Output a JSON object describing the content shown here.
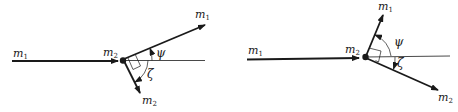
{
  "diagrams": [
    {
      "id": "left",
      "incoming_label": {
        "base": "m",
        "sub": "1"
      },
      "target_label": {
        "base": "m",
        "sub": "2"
      },
      "outgoing_1_label": {
        "base": "m",
        "sub": "1"
      },
      "outgoing_2_label": {
        "base": "m",
        "sub": "2"
      },
      "angle_1": "ψ",
      "angle_2": "ζ"
    },
    {
      "id": "right",
      "incoming_label": {
        "base": "m",
        "sub": "1"
      },
      "target_label": {
        "base": "m",
        "sub": "2"
      },
      "outgoing_1_label": {
        "base": "m",
        "sub": "1"
      },
      "outgoing_2_label": {
        "base": "m",
        "sub": "2"
      },
      "angle_1": "ψ",
      "angle_2": "ζ"
    }
  ],
  "colors": {
    "ink": "#1a1a1a"
  }
}
